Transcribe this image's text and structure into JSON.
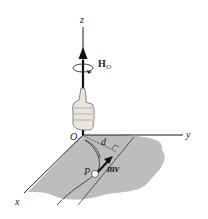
{
  "diagram": {
    "axes": {
      "x": "x",
      "y": "y",
      "z": "z",
      "origin": "O"
    },
    "vector_label_main": "H",
    "vector_label_sub": "O",
    "distance_label": "d",
    "particle_label": "P",
    "momentum_label": "mv",
    "colors": {
      "plane": "#b9b9b9",
      "lines": "#1a1a1a",
      "hand": "#e8e2d8"
    }
  }
}
